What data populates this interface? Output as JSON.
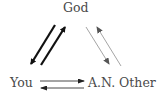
{
  "diagram": {
    "nodes": {
      "top": {
        "label": "God"
      },
      "bottom_left": {
        "label": "You"
      },
      "bottom_right": {
        "label": "A.N. Other"
      }
    },
    "edges": [
      {
        "from": "God",
        "to": "You",
        "style": "thick",
        "color": "#111111"
      },
      {
        "from": "You",
        "to": "God",
        "style": "thick",
        "color": "#111111"
      },
      {
        "from": "God",
        "to": "A.N. Other",
        "style": "thin",
        "color": "#8a8a8a"
      },
      {
        "from": "A.N. Other",
        "to": "God",
        "style": "thin",
        "color": "#8a8a8a"
      },
      {
        "from": "You",
        "to": "A.N. Other",
        "style": "thin",
        "color": "#333333"
      },
      {
        "from": "A.N. Other",
        "to": "You",
        "style": "thin",
        "color": "#333333"
      }
    ]
  }
}
